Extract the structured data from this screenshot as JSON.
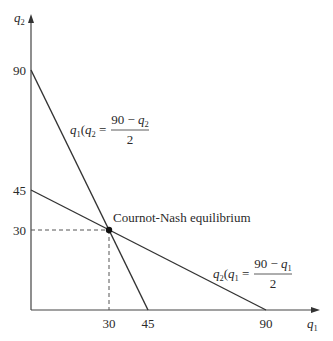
{
  "diagram": {
    "axes": {
      "x": {
        "label": "q",
        "label_sub": "1",
        "ticks": [
          "30",
          "45",
          "90"
        ]
      },
      "y": {
        "label": "q",
        "label_sub": "2",
        "ticks": [
          "90",
          "45",
          "30"
        ]
      }
    },
    "reaction_functions": [
      {
        "name": "firm1",
        "lhs_var": "q",
        "lhs_sub": "1",
        "arg_var": "q",
        "arg_sub": "2",
        "numerator": "90 − ",
        "numerator_var": "q",
        "numerator_sub": "2",
        "denominator": "2",
        "from": [
          0,
          90
        ],
        "to": [
          45,
          0
        ]
      },
      {
        "name": "firm2",
        "lhs_var": "q",
        "lhs_sub": "2",
        "arg_var": "q",
        "arg_sub": "1",
        "numerator": "90 − ",
        "numerator_var": "q",
        "numerator_sub": "1",
        "denominator": "2",
        "from": [
          0,
          45
        ],
        "to": [
          90,
          0
        ]
      }
    ],
    "equilibrium": {
      "label": "Cournot-Nash equilibrium",
      "q1": 30,
      "q2": 30
    },
    "colors": {
      "line": "#333333",
      "text": "#2a2a2a",
      "background": "#ffffff"
    }
  }
}
